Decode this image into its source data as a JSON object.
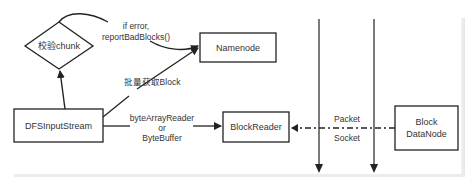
{
  "diagram": {
    "colors": {
      "stroke": "#222222",
      "text": "#333333",
      "background": "#ffffff",
      "frame": "#e8e8e8"
    },
    "nodes": {
      "check_chunk": {
        "label": "校验chunk",
        "shape": "diamond"
      },
      "namenode": {
        "label": "Namenode",
        "shape": "rect"
      },
      "dfs_input_stream": {
        "label": "DFSInputStream",
        "shape": "rect"
      },
      "block_reader": {
        "label": "BlockReader",
        "shape": "rect"
      },
      "block_datanode": {
        "label_line1": "Block",
        "label_line2": "DataNode",
        "shape": "rect"
      }
    },
    "edges": {
      "stream_to_check": {
        "from": "DFSInputStream",
        "to": "校验chunk",
        "style": "solid"
      },
      "check_to_namenode": {
        "label_line1": "if error,",
        "label_line2": "reportBadBlocks()",
        "from": "校验chunk",
        "to": "Namenode",
        "style": "solid-curve"
      },
      "stream_to_namenode": {
        "label": "批量获取Block",
        "from": "DFSInputStream",
        "to": "Namenode",
        "style": "solid"
      },
      "stream_to_reader": {
        "label_line1": "byteArrayReader",
        "label_line2": "or",
        "label_line3": "ByteBuffer",
        "from": "DFSInputStream",
        "to": "BlockReader",
        "style": "solid"
      },
      "datanode_to_reader": {
        "label_top": "Packet",
        "label_bottom": "Socket",
        "from": "Block DataNode",
        "to": "BlockReader",
        "style": "dash-dot"
      }
    },
    "lanes": [
      {
        "name": "lane-1",
        "direction": "down"
      },
      {
        "name": "lane-2",
        "direction": "down"
      }
    ]
  }
}
